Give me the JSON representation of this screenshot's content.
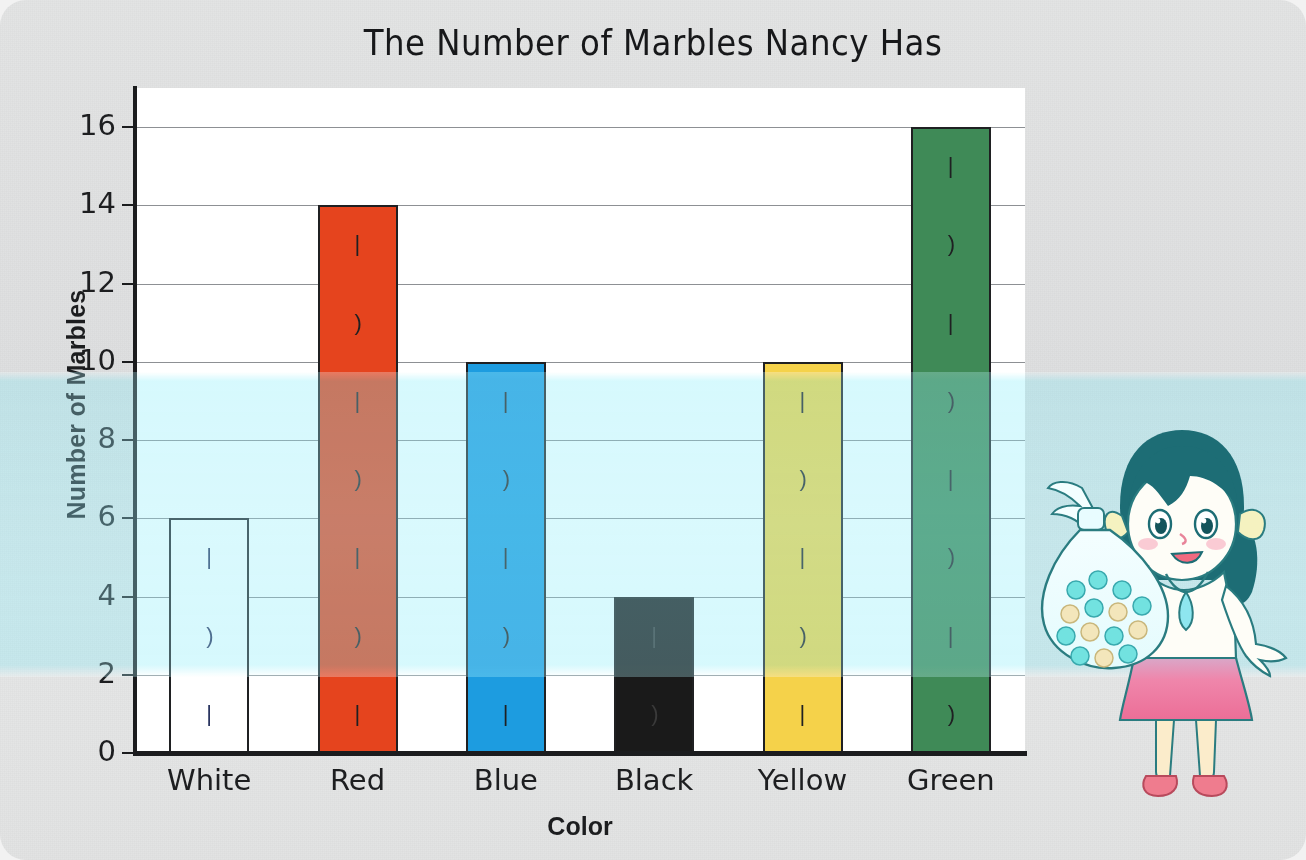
{
  "chart_data": {
    "type": "bar",
    "title": "The Number of Marbles Nancy Has",
    "xlabel": "Color",
    "ylabel": "Number of Marbles",
    "categories": [
      "White",
      "Red",
      "Blue",
      "Black",
      "Yellow",
      "Green"
    ],
    "values": [
      6,
      14,
      10,
      4,
      10,
      16
    ],
    "ylim": [
      0,
      17
    ],
    "yticks": [
      0,
      2,
      4,
      6,
      8,
      10,
      12,
      14,
      16
    ],
    "ytick_labels": [
      "0",
      "2",
      "4",
      "6",
      "8",
      "10",
      "12",
      "14",
      "16"
    ],
    "grid": true,
    "legend": false,
    "bar_colors": [
      "#ffffff",
      "#e5441e",
      "#1d9ce0",
      "#1a1a1a",
      "#f5d24a",
      "#3f8a57"
    ],
    "bar_edge_color": "#1f2022",
    "plot_background": "#ffffff"
  },
  "page": {
    "background_color": "#e2e3e3",
    "overlay_band_color": "#c9f5fc"
  },
  "illustration": {
    "name": "girl-with-marble-bag",
    "alt": "Cartoon girl with pigtails holding a clear bag full of marbles",
    "hair_color": "#1c6b72",
    "skirt_color": "#e87ea0",
    "skin_color": "#fdf0df",
    "bag_marble_colors": [
      "#6fe3e0",
      "#f2e4b8"
    ]
  }
}
